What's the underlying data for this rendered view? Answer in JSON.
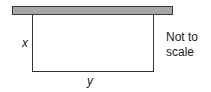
{
  "diagram": {
    "wall_label": "",
    "side_label_x": "x",
    "side_label_y": "y",
    "note_line1": "Not to",
    "note_line2": "scale",
    "colors": {
      "wall_fill": "#a6a6a6",
      "line": "#333333"
    }
  }
}
